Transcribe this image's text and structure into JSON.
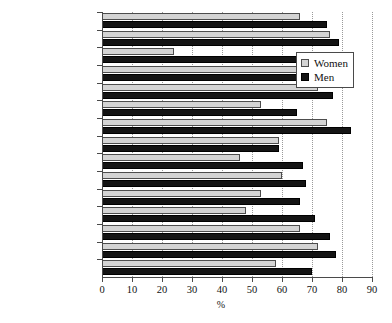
{
  "chart_data": {
    "type": "bar",
    "orientation": "horizontal",
    "title": "",
    "xlabel": "%",
    "ylabel": "",
    "xlim": [
      0,
      90
    ],
    "xticks": [
      0,
      10,
      20,
      30,
      40,
      50,
      60,
      70,
      80,
      90
    ],
    "grid": true,
    "legend_position": "top-right",
    "categories": [
      "United States",
      "Norway",
      "Turkey",
      "United Kingdom",
      "Sweden",
      "Poland",
      "Netherlands",
      "Lithuania",
      "Italy",
      "France",
      "Spain",
      "Greece",
      "Germany",
      "Denmark",
      "EU (27 countries)"
    ],
    "series": [
      {
        "name": "Women",
        "color": "#d4d4d4",
        "values": [
          66,
          76,
          24,
          67,
          72,
          53,
          75,
          59,
          46,
          60,
          53,
          48,
          66,
          72,
          58
        ]
      },
      {
        "name": "Men",
        "color": "#141414",
        "values": [
          75,
          79,
          66,
          71,
          77,
          65,
          83,
          59,
          67,
          68,
          66,
          71,
          76,
          78,
          70
        ]
      }
    ]
  },
  "legend": {
    "items": [
      {
        "label": "Women",
        "key": "women"
      },
      {
        "label": "Men",
        "key": "men"
      }
    ]
  },
  "axis": {
    "x_title": "%"
  }
}
